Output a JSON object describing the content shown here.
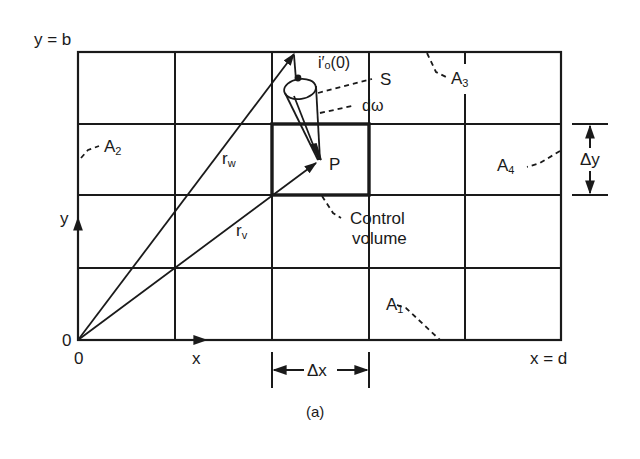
{
  "figure": {
    "caption": "(a)",
    "colors": {
      "ink": "#1a1a1a",
      "background": "#ffffff"
    },
    "domain_bounds": {
      "top_label": "y = b",
      "right_label": "x = d"
    },
    "origin": {
      "origin_label_left": "0",
      "origin_label_below": "0"
    },
    "axes": {
      "x_label": "x",
      "y_label": "y"
    },
    "vectors": [
      {
        "name": "r",
        "subscript": "w"
      },
      {
        "name": "r",
        "subscript": "v"
      }
    ],
    "point": {
      "label": "P"
    },
    "intensity": {
      "label": "i′ₒ(0)"
    },
    "surface": {
      "label": "S"
    },
    "solid_angle": {
      "label": "dω"
    },
    "control_volume": {
      "line1": "Control",
      "line2": "volume"
    },
    "boundaries": [
      {
        "name": "A",
        "subscript": "1"
      },
      {
        "name": "A",
        "subscript": "2"
      },
      {
        "name": "A",
        "subscript": "3"
      },
      {
        "name": "A",
        "subscript": "4"
      }
    ],
    "increments": {
      "dx": "Δx",
      "dy": "Δy"
    },
    "grid": {
      "columns": 5,
      "rows": 4
    }
  }
}
